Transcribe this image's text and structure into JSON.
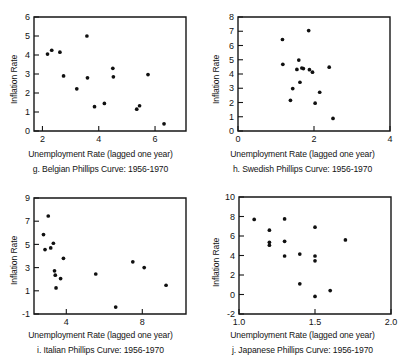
{
  "figure": {
    "shared_xlabel": "Unemployment Rate (lagged one year)",
    "shared_ylabel": "Inflation Rate"
  },
  "chart_data": [
    {
      "id": "g",
      "type": "scatter",
      "title": "g. Belgian Phillips Curve: 1956-1970",
      "xlabel": "Unemployment Rate (lagged one year)",
      "ylabel": "Inflation Rate",
      "xlim": [
        1.7,
        7.1
      ],
      "ylim": [
        0,
        6
      ],
      "xticks": [
        2,
        4,
        6
      ],
      "yticks": [
        0,
        1,
        2,
        3,
        4,
        5,
        6
      ],
      "grid": false,
      "legend": "none",
      "points": [
        {
          "x": 2.18,
          "y": 4.05
        },
        {
          "x": 2.33,
          "y": 4.25
        },
        {
          "x": 2.62,
          "y": 4.15
        },
        {
          "x": 2.75,
          "y": 2.9
        },
        {
          "x": 3.22,
          "y": 2.22
        },
        {
          "x": 3.58,
          "y": 5.0
        },
        {
          "x": 3.6,
          "y": 2.8
        },
        {
          "x": 3.85,
          "y": 1.28
        },
        {
          "x": 4.2,
          "y": 1.45
        },
        {
          "x": 4.5,
          "y": 3.3
        },
        {
          "x": 4.52,
          "y": 2.85
        },
        {
          "x": 5.35,
          "y": 1.15
        },
        {
          "x": 5.45,
          "y": 1.33
        },
        {
          "x": 5.75,
          "y": 2.97
        },
        {
          "x": 6.32,
          "y": 0.38
        }
      ]
    },
    {
      "id": "h",
      "type": "scatter",
      "title": "h. Swedish Phillips Curve: 1956-1970",
      "xlabel": "Unemployment Rate (lagged one year)",
      "ylabel": "Inflation Rate",
      "xlim": [
        0,
        4
      ],
      "ylim": [
        0,
        8
      ],
      "xticks": [
        0,
        2,
        4
      ],
      "yticks": [
        0,
        1,
        2,
        3,
        4,
        5,
        6,
        7,
        8
      ],
      "grid": false,
      "legend": "none",
      "points": [
        {
          "x": 1.17,
          "y": 6.42
        },
        {
          "x": 1.18,
          "y": 4.68
        },
        {
          "x": 1.38,
          "y": 2.15
        },
        {
          "x": 1.44,
          "y": 2.98
        },
        {
          "x": 1.55,
          "y": 4.32
        },
        {
          "x": 1.6,
          "y": 4.98
        },
        {
          "x": 1.63,
          "y": 3.42
        },
        {
          "x": 1.68,
          "y": 4.42
        },
        {
          "x": 1.72,
          "y": 4.38
        },
        {
          "x": 1.86,
          "y": 7.05
        },
        {
          "x": 1.88,
          "y": 4.3
        },
        {
          "x": 1.96,
          "y": 4.13
        },
        {
          "x": 2.03,
          "y": 1.95
        },
        {
          "x": 2.15,
          "y": 2.72
        },
        {
          "x": 2.4,
          "y": 4.48
        },
        {
          "x": 2.5,
          "y": 0.88
        }
      ]
    },
    {
      "id": "i",
      "type": "scatter",
      "title": "i. Italian Phillips Curve: 1956-1970",
      "xlabel": "Unemployment Rate (lagged one year)",
      "ylabel": "Inflation Rate",
      "xlim": [
        2.3,
        10.3
      ],
      "ylim": [
        -1,
        9
      ],
      "xticks": [
        4,
        8
      ],
      "yticks": [
        -1,
        1,
        3,
        5,
        7,
        9
      ],
      "grid": false,
      "legend": "none",
      "points": [
        {
          "x": 2.8,
          "y": 5.85
        },
        {
          "x": 2.88,
          "y": 4.55
        },
        {
          "x": 3.05,
          "y": 7.45
        },
        {
          "x": 3.18,
          "y": 4.7
        },
        {
          "x": 3.32,
          "y": 5.1
        },
        {
          "x": 3.38,
          "y": 2.72
        },
        {
          "x": 3.42,
          "y": 2.35
        },
        {
          "x": 3.46,
          "y": 1.25
        },
        {
          "x": 3.7,
          "y": 2.05
        },
        {
          "x": 3.85,
          "y": 3.8
        },
        {
          "x": 5.55,
          "y": 2.45
        },
        {
          "x": 6.6,
          "y": -0.4
        },
        {
          "x": 7.5,
          "y": 3.5
        },
        {
          "x": 8.1,
          "y": 3.0
        },
        {
          "x": 9.25,
          "y": 1.48
        }
      ]
    },
    {
      "id": "j",
      "type": "scatter",
      "title": "j. Japanese Phillips Curve: 1956-1970",
      "xlabel": "Unemployment Rate (lagged one year)",
      "ylabel": "Inflation Rate",
      "xlim": [
        1.0,
        2.0
      ],
      "ylim": [
        -2,
        10
      ],
      "xticks": [
        1.0,
        1.5,
        2.0
      ],
      "xticklabels": [
        "1.0",
        "1.5",
        "2.0"
      ],
      "yticks": [
        -2,
        0,
        2,
        4,
        6,
        8,
        10
      ],
      "grid": false,
      "legend": "none",
      "points": [
        {
          "x": 1.1,
          "y": 7.7
        },
        {
          "x": 1.2,
          "y": 6.6
        },
        {
          "x": 1.2,
          "y": 5.35
        },
        {
          "x": 1.2,
          "y": 5.05
        },
        {
          "x": 1.3,
          "y": 7.75
        },
        {
          "x": 1.3,
          "y": 5.45
        },
        {
          "x": 1.3,
          "y": 3.95
        },
        {
          "x": 1.4,
          "y": 4.15
        },
        {
          "x": 1.4,
          "y": 1.1
        },
        {
          "x": 1.5,
          "y": 6.9
        },
        {
          "x": 1.5,
          "y": 3.95
        },
        {
          "x": 1.5,
          "y": 3.45
        },
        {
          "x": 1.5,
          "y": -0.2
        },
        {
          "x": 1.6,
          "y": 0.4
        },
        {
          "x": 1.7,
          "y": 5.6
        }
      ]
    }
  ]
}
